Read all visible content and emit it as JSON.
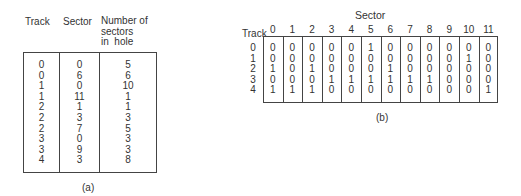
{
  "table_a": {
    "headers": [
      "Track",
      "Sector",
      "Number of sectors in hole"
    ],
    "header_lines": [
      "Number of",
      "sectors",
      "in  hole"
    ],
    "rows": [
      [
        "0",
        "0",
        "5"
      ],
      [
        "0",
        "6",
        "6"
      ],
      [
        "1",
        "0",
        "10"
      ],
      [
        "1",
        "11",
        "1"
      ],
      [
        "2",
        "1",
        "1"
      ],
      [
        "2",
        "3",
        "3"
      ],
      [
        "2",
        "7",
        "5"
      ],
      [
        "3",
        "0",
        "3"
      ],
      [
        "3",
        "9",
        "3"
      ],
      [
        "4",
        "3",
        "8"
      ]
    ],
    "caption": "(a)"
  },
  "table_b": {
    "column_group_title": "Sector",
    "row_header_title": "Track",
    "columns": [
      "0",
      "1",
      "2",
      "3",
      "4",
      "5",
      "6",
      "7",
      "8",
      "9",
      "10",
      "11"
    ],
    "tracks": [
      "0",
      "1",
      "2",
      "3",
      "4"
    ],
    "matrix": [
      [
        "0",
        "0",
        "0",
        "0",
        "0",
        "1",
        "0",
        "0",
        "0",
        "0",
        "0",
        "0"
      ],
      [
        "0",
        "0",
        "0",
        "0",
        "0",
        "0",
        "0",
        "0",
        "0",
        "0",
        "1",
        "0"
      ],
      [
        "1",
        "0",
        "1",
        "0",
        "0",
        "0",
        "1",
        "0",
        "0",
        "0",
        "0",
        "0"
      ],
      [
        "0",
        "0",
        "0",
        "1",
        "1",
        "1",
        "1",
        "1",
        "1",
        "0",
        "0",
        "0"
      ],
      [
        "1",
        "1",
        "1",
        "0",
        "0",
        "0",
        "0",
        "0",
        "0",
        "0",
        "0",
        "1"
      ]
    ],
    "caption": "(b)"
  }
}
